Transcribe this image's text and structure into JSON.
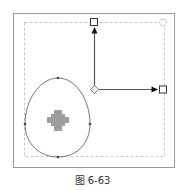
{
  "figure": {
    "caption": "图 6-63",
    "colors": {
      "frame": "#9a9a9a",
      "dashed_box": "#c8c8c8",
      "axis": "#555555",
      "arrowhead": "#111111",
      "handle_stroke": "#333333",
      "egg_stroke": "#666666",
      "anchor": "#444444",
      "blob": "#9e9e9e"
    },
    "elements": {
      "origin_handle": "diamond",
      "y_axis_handle": "square",
      "x_axis_handle": "square",
      "rotate_handle": "circle",
      "egg_anchor_points": 4
    }
  }
}
